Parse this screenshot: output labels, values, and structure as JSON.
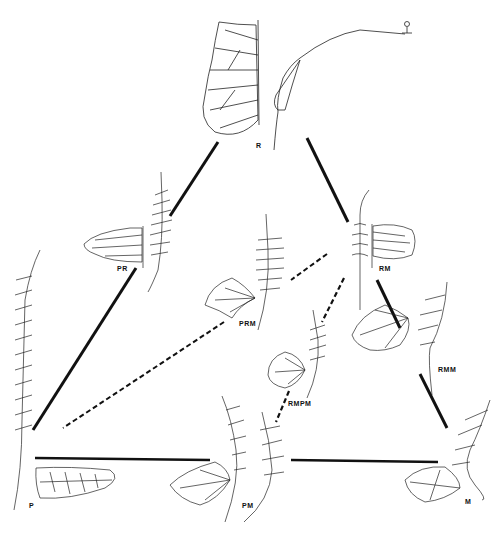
{
  "diagram": {
    "type": "fern hybridization triangle",
    "nodes": [
      {
        "id": "R",
        "label": "R",
        "x": 258,
        "y": 145
      },
      {
        "id": "PR",
        "label": "PR",
        "x": 118,
        "y": 268
      },
      {
        "id": "RM",
        "label": "RM",
        "x": 380,
        "y": 268
      },
      {
        "id": "PRM",
        "label": "PRM",
        "x": 240,
        "y": 322
      },
      {
        "id": "RMM",
        "label": "RMM",
        "x": 440,
        "y": 368
      },
      {
        "id": "RMPM",
        "label": "RMPM",
        "x": 290,
        "y": 402
      },
      {
        "id": "P",
        "label": "P",
        "x": 30,
        "y": 505
      },
      {
        "id": "PM",
        "label": "PM",
        "x": 243,
        "y": 505
      },
      {
        "id": "M",
        "label": "M",
        "x": 465,
        "y": 500
      }
    ],
    "edges": [
      {
        "from": "R",
        "to": "PR",
        "style": "solid"
      },
      {
        "from": "PR",
        "to": "P",
        "style": "solid"
      },
      {
        "from": "R",
        "to": "RM",
        "style": "solid"
      },
      {
        "from": "RM",
        "to": "M",
        "style": "solid"
      },
      {
        "from": "P",
        "to": "PM",
        "style": "solid"
      },
      {
        "from": "PM",
        "to": "M",
        "style": "solid"
      },
      {
        "from": "RM",
        "to": "PRM",
        "style": "dashed"
      },
      {
        "from": "PRM",
        "to": "P",
        "style": "dashed"
      },
      {
        "from": "RM",
        "to": "RMPM",
        "style": "dashed"
      },
      {
        "from": "RMPM",
        "to": "PM",
        "style": "dashed"
      }
    ]
  },
  "labels": {
    "r": "R",
    "pr": "PR",
    "rm": "RM",
    "prm": "PRM",
    "rmm": "RMM",
    "rmpm": "RMPM",
    "p": "P",
    "pm": "PM",
    "m": "M"
  }
}
